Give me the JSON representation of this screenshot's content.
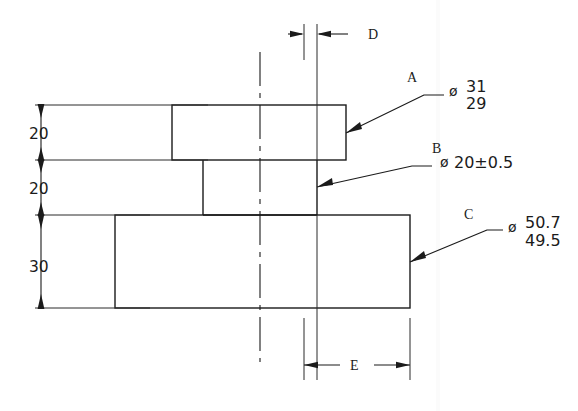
{
  "drawing": {
    "title": "Stepped shaft part drawing",
    "background_color": "#ffffff",
    "line_color": "#1b1b1b",
    "vertical_dimensions": [
      {
        "name": "top-flange-height",
        "value": "20"
      },
      {
        "name": "neck-height",
        "value": "20"
      },
      {
        "name": "base-height",
        "value": "30"
      }
    ],
    "horizontal_dimensions": [
      {
        "name": "dimension-d",
        "value": "D",
        "position": "top"
      },
      {
        "name": "dimension-e",
        "value": "E",
        "position": "bottom"
      }
    ],
    "feature_callouts": [
      {
        "id": "A",
        "label": "A",
        "symbol": "ø",
        "upper": "31",
        "lower": "29",
        "tolerance_style": "limits"
      },
      {
        "id": "B",
        "label": "B",
        "symbol": "ø",
        "value": "20±0.5",
        "tolerance_style": "plus-minus"
      },
      {
        "id": "C",
        "label": "C",
        "symbol": "ø",
        "upper": "50.7",
        "lower": "49.5",
        "tolerance_style": "limits"
      }
    ]
  }
}
